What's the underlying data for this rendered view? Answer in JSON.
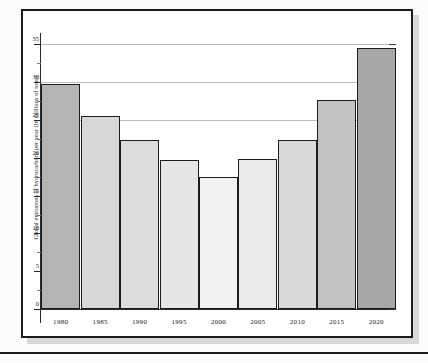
{
  "figure": {
    "frame_color": "#1b1b1b",
    "shadow_color": "#d8d8d8",
    "background": "#ffffff"
  },
  "chart_data": {
    "type": "bar",
    "title": "",
    "subtitle": "",
    "xlabel": "",
    "ylabel": "Global emissions of hydrocarbons per year (in millions of tons)",
    "categories": [
      "1980",
      "1985",
      "1990",
      "1995",
      "2000",
      "2005",
      "2010",
      "2015",
      "2020"
    ],
    "values": [
      29.8,
      25.5,
      22.3,
      19.7,
      17.5,
      19.8,
      22.3,
      27.6,
      34.5
    ],
    "bar_colors": [
      "#b4b4b4",
      "#d8d8d8",
      "#dcdcdc",
      "#e6e6e6",
      "#f2f2f2",
      "#eaeaea",
      "#dadada",
      "#c2c2c2",
      "#a8a8a8"
    ],
    "bar_edge_color": "#1c1c1c",
    "ylim": [
      0,
      36.5
    ],
    "yticks": [
      0,
      5,
      10,
      15,
      20,
      25,
      30,
      35
    ],
    "ytick_labels": [
      "0",
      "5",
      "10",
      "15",
      "20",
      "25",
      "30",
      "35"
    ],
    "gridlines_at": [
      25,
      30,
      35
    ],
    "grid": true,
    "grid_color": "#b9b9b9",
    "legend": "none",
    "legend_position": "none"
  }
}
